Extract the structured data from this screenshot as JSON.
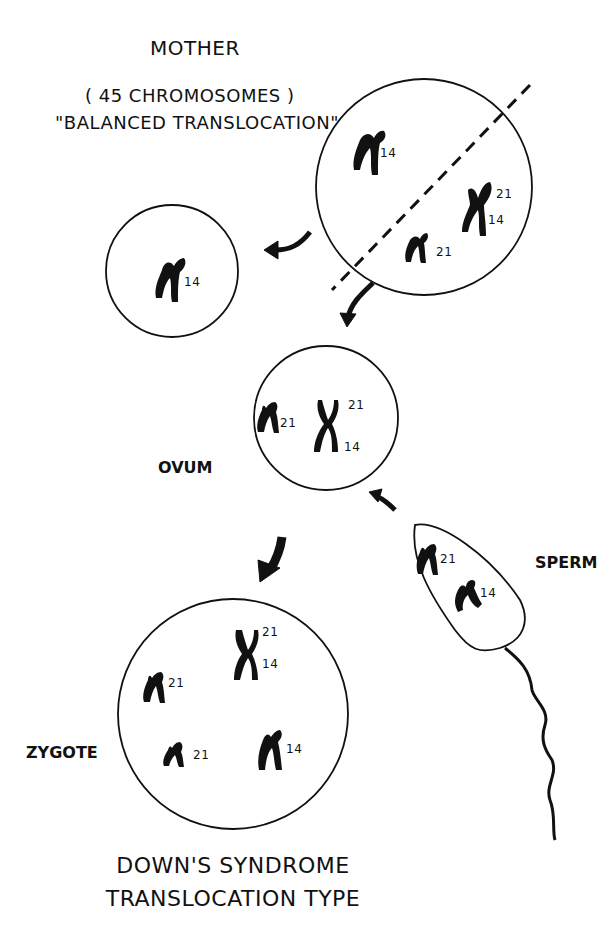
{
  "labels": {
    "mother": "MOTHER",
    "mother_count": "( 45 CHROMOSOMES )",
    "mother_type": "\"BALANCED TRANSLOCATION\"",
    "ovum": "OVUM",
    "sperm": "SPERM",
    "zygote": "ZYGOTE",
    "caption_line1": "DOWN'S SYNDROME",
    "caption_line2": "TRANSLOCATION TYPE"
  },
  "cells": {
    "mother": {
      "chromosomes": [
        "14",
        "21",
        "14",
        "21"
      ]
    },
    "discarded": {
      "chromosomes": [
        "14"
      ]
    },
    "ovum": {
      "chromosomes": [
        "21",
        "21",
        "14"
      ]
    },
    "sperm": {
      "chromosomes": [
        "21",
        "14"
      ]
    },
    "zygote": {
      "chromosomes": [
        "21",
        "14",
        "21",
        "21",
        "14"
      ]
    }
  },
  "colors": {
    "ink": "#111111",
    "background": "#ffffff"
  }
}
